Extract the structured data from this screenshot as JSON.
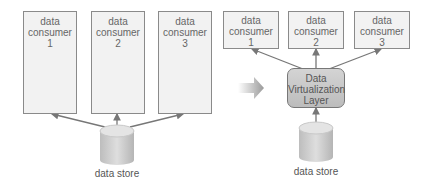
{
  "left_diagram": {
    "consumers": [
      {
        "line1": "data",
        "line2": "consumer",
        "line3": "1"
      },
      {
        "line1": "data",
        "line2": "consumer",
        "line3": "2"
      },
      {
        "line1": "data",
        "line2": "consumer",
        "line3": "3"
      }
    ],
    "store_label": "data store"
  },
  "right_diagram": {
    "consumers": [
      {
        "line1": "data",
        "line2": "consumer",
        "line3": "1"
      },
      {
        "line1": "data",
        "line2": "consumer",
        "line3": "2"
      },
      {
        "line1": "data",
        "line2": "consumer",
        "line3": "3"
      }
    ],
    "layer": {
      "line1": "Data",
      "line2": "Virtualization",
      "line3": "Layer"
    },
    "store_label": "data store"
  },
  "colors": {
    "box_fill": "#f2f2f2",
    "border": "#8a8a8a",
    "arrow": "#777777",
    "layer_fill": "#c8c8c8"
  }
}
